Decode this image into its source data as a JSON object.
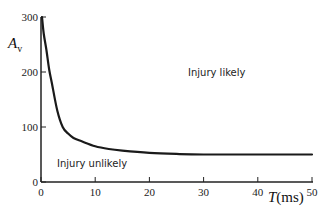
{
  "chart_data": {
    "type": "line",
    "title": "",
    "xlabel": "T(ms)",
    "ylabel": "Av",
    "xlim": [
      0,
      50
    ],
    "ylim": [
      0,
      300
    ],
    "grid": false,
    "legend": null,
    "x_ticks": [
      0,
      10,
      20,
      30,
      40,
      50
    ],
    "y_ticks": [
      0,
      100,
      200,
      300
    ],
    "series": [
      {
        "name": "injury threshold",
        "x": [
          0,
          0.5,
          1,
          1.5,
          2,
          3,
          4,
          5,
          6,
          7.5,
          10,
          12.5,
          15,
          20,
          25,
          30,
          40,
          50
        ],
        "y": [
          300,
          270,
          240,
          205,
          180,
          130,
          100,
          88,
          80,
          74,
          65,
          60,
          57,
          53,
          51,
          50,
          50,
          50
        ]
      }
    ],
    "annotations": [
      {
        "text": "Injury likely",
        "x": 26,
        "y": 190
      },
      {
        "text": "Injury unlikely",
        "x": 9,
        "y": 28
      }
    ]
  },
  "labels": {
    "y_axis_main": "A",
    "y_axis_sub": "v",
    "x_axis_italic": "T",
    "x_axis_unit": "(ms)",
    "region_above": "Injury likely",
    "region_below": "Injury unlikely",
    "x_tick_labels": [
      "0",
      "10",
      "20",
      "30",
      "40",
      "50"
    ],
    "y_tick_labels": [
      "0",
      "100",
      "200",
      "300"
    ]
  }
}
